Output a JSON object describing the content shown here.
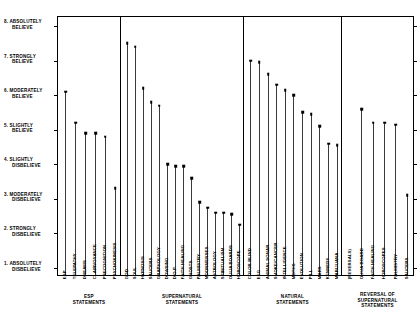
{
  "chart_data": {
    "type": "scatter",
    "title": "",
    "xlabel": "",
    "ylabel": "",
    "ylim": [
      1,
      8
    ],
    "grid": false,
    "legend": "none",
    "y_tick_labels": [
      {
        "value": 8,
        "line1": "8. ABSOLUTELY",
        "line2": "BELIEVE"
      },
      {
        "value": 7,
        "line1": "7. STRONGLY",
        "line2": "BELIEVE"
      },
      {
        "value": 6,
        "line1": "6. MODERATELY",
        "line2": "BELIEVE"
      },
      {
        "value": 5,
        "line1": "5. SLIGHTLY",
        "line2": "BELIEVE"
      },
      {
        "value": 4,
        "line1": "4. SLIGHTLY",
        "line2": "DISBELIEVE"
      },
      {
        "value": 3,
        "line1": "3. MODERATELY",
        "line2": "DISBELIEVE"
      },
      {
        "value": 2,
        "line1": "2. STRONGLY",
        "line2": "DISBELIEVE"
      },
      {
        "value": 1,
        "line1": "1. ABSOLUTELY",
        "line2": "DISBELIEVE"
      }
    ],
    "groups": [
      {
        "id": "esp",
        "title_lines": [
          "ESP",
          "STATEMENTS"
        ],
        "categories": [
          "ESP",
          "TELEPATHY",
          "DREAMS",
          "CLAIRVOYANCE",
          "PRECOGNITION",
          "PSYCHOKINESIS"
        ],
        "values": [
          6.1,
          5.2,
          4.9,
          4.9,
          4.8,
          3.3
        ]
      },
      {
        "id": "supernatural",
        "title_lines": [
          "SUPERNATURAL",
          "STATEMENTS"
        ],
        "categories": [
          "GOD",
          "SOUL",
          "HYPNOSIS",
          "SAUCERS",
          "GRAPHOLOGY",
          "DOWSING",
          "D.O.P.",
          "FAITH HEALING",
          "GHOSTS",
          "PALMISTRY",
          "MOONMENSES",
          "ASTROLOGY",
          "SPIRITUALISM",
          "OUIJA BOARDS",
          "HOROSCOPE"
        ],
        "values": [
          7.5,
          7.4,
          6.2,
          5.8,
          5.7,
          4.0,
          3.95,
          3.95,
          3.6,
          2.9,
          2.75,
          2.6,
          2.6,
          2.55,
          2.25
        ]
      },
      {
        "id": "natural",
        "title_lines": [
          "NATURAL",
          "STATEMENTS"
        ],
        "categories": [
          "COLOR BLIND",
          "EEG",
          "ANIMAL SONAR",
          "SMOKE/CANCER",
          "INTELLIGENCE",
          "MOTHS",
          "EVOLUTION",
          "PILL",
          "MARS",
          "KENNEDY",
          "MARIJUANA"
        ],
        "values": [
          7.0,
          6.95,
          6.6,
          6.3,
          6.15,
          6.0,
          5.5,
          5.45,
          5.1,
          4.6,
          4.55
        ]
      },
      {
        "id": "reversal",
        "title_lines": [
          "REVERSAL OF",
          "SUPERNATURAL",
          "STATEMENTS"
        ],
        "categories": [
          "(REVERSALS)",
          "OUIJA BOARD",
          "FAITH HEALING",
          "HOROSCOPES",
          "PALMISTRY",
          "SAUCERS"
        ],
        "values": [
          null,
          5.6,
          5.2,
          5.2,
          5.15,
          3.1
        ]
      }
    ]
  }
}
